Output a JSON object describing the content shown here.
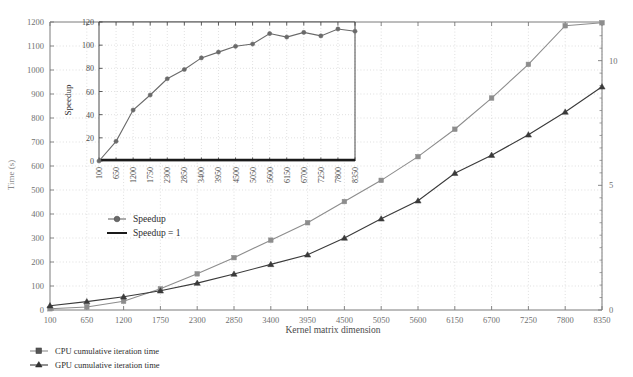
{
  "figure": {
    "background": "#ffffff",
    "text_color": "#3c3c3c"
  },
  "colors": {
    "cpu": "#8d8d8d",
    "gpu": "#3a3a3a",
    "speedup": "#6a6a6a",
    "speedup_one": "#1a1a1a",
    "grid": "#c9c9c9",
    "axis": "#7a7a7a",
    "inset_axis": "#4a4a4a",
    "tick_label": "#6f6f6f",
    "axis_label": "#8a8a8a"
  },
  "main_axis_labels": {
    "xlabel": "Kernel matrix dimension",
    "ylabel_left": "Time (s)",
    "ylabel_right": ""
  },
  "legend_bottom": {
    "items": [
      {
        "label": "CPU cumulative iteration time",
        "marker": "square",
        "color": "#8d8d8d"
      },
      {
        "label": "GPU cumulative iteration time",
        "marker": "triangle",
        "color": "#3a3a3a"
      }
    ]
  },
  "legend_inset": {
    "items": [
      {
        "label": "Speedup",
        "marker": "circle",
        "color": "#6a6a6a"
      },
      {
        "label": "Speedup = 1",
        "marker": "line",
        "color": "#1a1a1a"
      }
    ]
  },
  "inset_axis_labels": {
    "ylabel": "Speedup"
  },
  "chart_data": [
    {
      "type": "line",
      "name": "main-plot",
      "title": "",
      "xlabel": "Kernel matrix dimension",
      "ylabel": "Time (s)",
      "ylabel_right": "",
      "grid": true,
      "legend_position": "below-plot",
      "categories": [
        100,
        650,
        1200,
        1750,
        2300,
        2850,
        3400,
        3950,
        4500,
        5050,
        5600,
        6150,
        6700,
        7250,
        7800,
        8350
      ],
      "xticklabels": [
        "100",
        "650",
        "1200",
        "1750",
        "2300",
        "2850",
        "3400",
        "3950",
        "4500",
        "5050",
        "5600",
        "6150",
        "6700",
        "7250",
        "7800",
        "8350"
      ],
      "ylim_left": [
        0,
        1200
      ],
      "yticks_left": [
        0,
        100,
        200,
        300,
        400,
        500,
        600,
        700,
        800,
        900,
        1000,
        1100,
        1200
      ],
      "yticklabels_left": [
        "0",
        "100",
        "200",
        "300",
        "400",
        "500",
        "600",
        "700",
        "800",
        "900",
        "1000",
        "1100",
        "1200"
      ],
      "ylim_right": [
        0,
        11.55
      ],
      "yticks_right": [
        0,
        5,
        10
      ],
      "yticklabels_right": [
        "0",
        "5",
        "10"
      ],
      "series": [
        {
          "name": "CPU cumulative iteration time",
          "axis": "right",
          "marker": "square",
          "color": "#8d8d8d",
          "values": [
            0.05,
            0.12,
            0.35,
            0.85,
            1.45,
            2.1,
            2.8,
            3.5,
            4.35,
            5.2,
            6.15,
            7.25,
            8.5,
            9.85,
            11.4,
            11.52
          ]
        },
        {
          "name": "GPU cumulative iteration time",
          "axis": "left",
          "marker": "triangle",
          "color": "#3a3a3a",
          "values": [
            18,
            35,
            55,
            80,
            112,
            150,
            190,
            230,
            300,
            380,
            455,
            570,
            645,
            730,
            825,
            930
          ]
        }
      ]
    },
    {
      "type": "line",
      "name": "inset-speedup-plot",
      "title": "",
      "xlabel": "",
      "ylabel": "Speedup",
      "grid": true,
      "legend_position": "outside-below",
      "categories": [
        100,
        650,
        1200,
        1750,
        2300,
        2850,
        3400,
        3950,
        4500,
        5050,
        5600,
        6150,
        6700,
        7250,
        7800,
        8350
      ],
      "xticklabels": [
        "100",
        "650",
        "1200",
        "1750",
        "2300",
        "2850",
        "3400",
        "3950",
        "4500",
        "5050",
        "5600",
        "6150",
        "6700",
        "7250",
        "7800",
        "8350"
      ],
      "ylim": [
        0,
        120
      ],
      "yticks": [
        0,
        20,
        40,
        60,
        80,
        100,
        120
      ],
      "yticklabels": [
        "0",
        "20",
        "40",
        "60",
        "80",
        "100",
        "120"
      ],
      "series": [
        {
          "name": "Speedup",
          "marker": "circle",
          "color": "#6a6a6a",
          "values": [
            0,
            17,
            44,
            57,
            71,
            79,
            89,
            94,
            99,
            101,
            110,
            107,
            111,
            108,
            114,
            112
          ]
        },
        {
          "name": "Speedup = 1",
          "marker": "line",
          "color": "#1a1a1a",
          "values": [
            1,
            1,
            1,
            1,
            1,
            1,
            1,
            1,
            1,
            1,
            1,
            1,
            1,
            1,
            1,
            1
          ]
        }
      ]
    }
  ]
}
